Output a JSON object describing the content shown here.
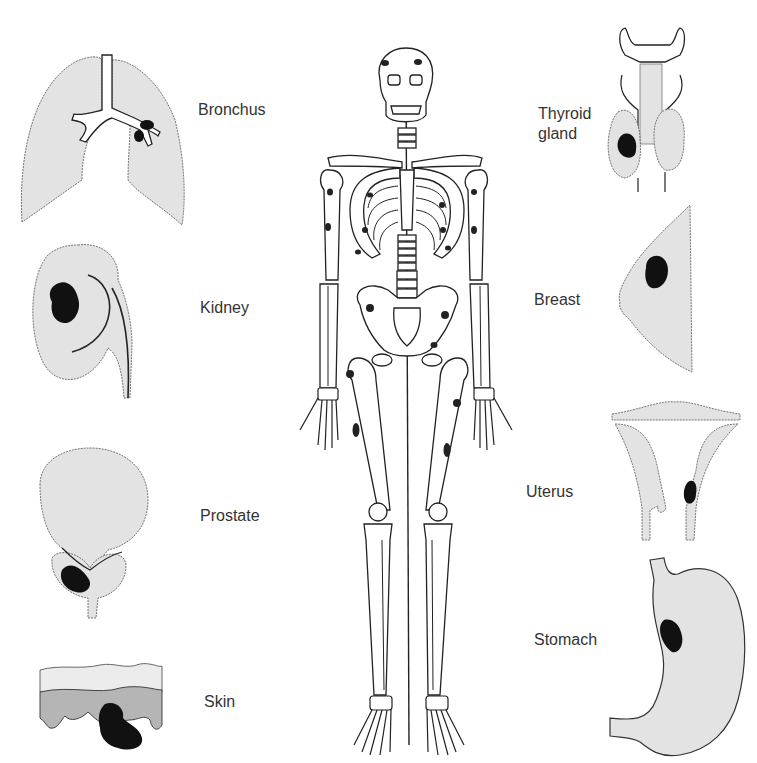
{
  "figure": {
    "colors": {
      "organ_fill": "#e3e3e3",
      "tumor": "#111111",
      "outline": "#222222",
      "background": "#ffffff"
    }
  },
  "left_panels": [
    {
      "id": "bronchus",
      "label": "Bronchus"
    },
    {
      "id": "kidney",
      "label": "Kidney"
    },
    {
      "id": "prostate",
      "label": "Prostate"
    },
    {
      "id": "skin",
      "label": "Skin"
    }
  ],
  "right_panels": [
    {
      "id": "thyroid",
      "label_line1": "Thyroid",
      "label_line2": "gland"
    },
    {
      "id": "breast",
      "label": "Breast"
    },
    {
      "id": "uterus",
      "label": "Uterus"
    },
    {
      "id": "stomach",
      "label": "Stomach"
    }
  ],
  "center": {
    "id": "skeleton",
    "metastatic_sites": [
      "skull",
      "humerus",
      "ribs",
      "pelvis",
      "femur"
    ]
  }
}
